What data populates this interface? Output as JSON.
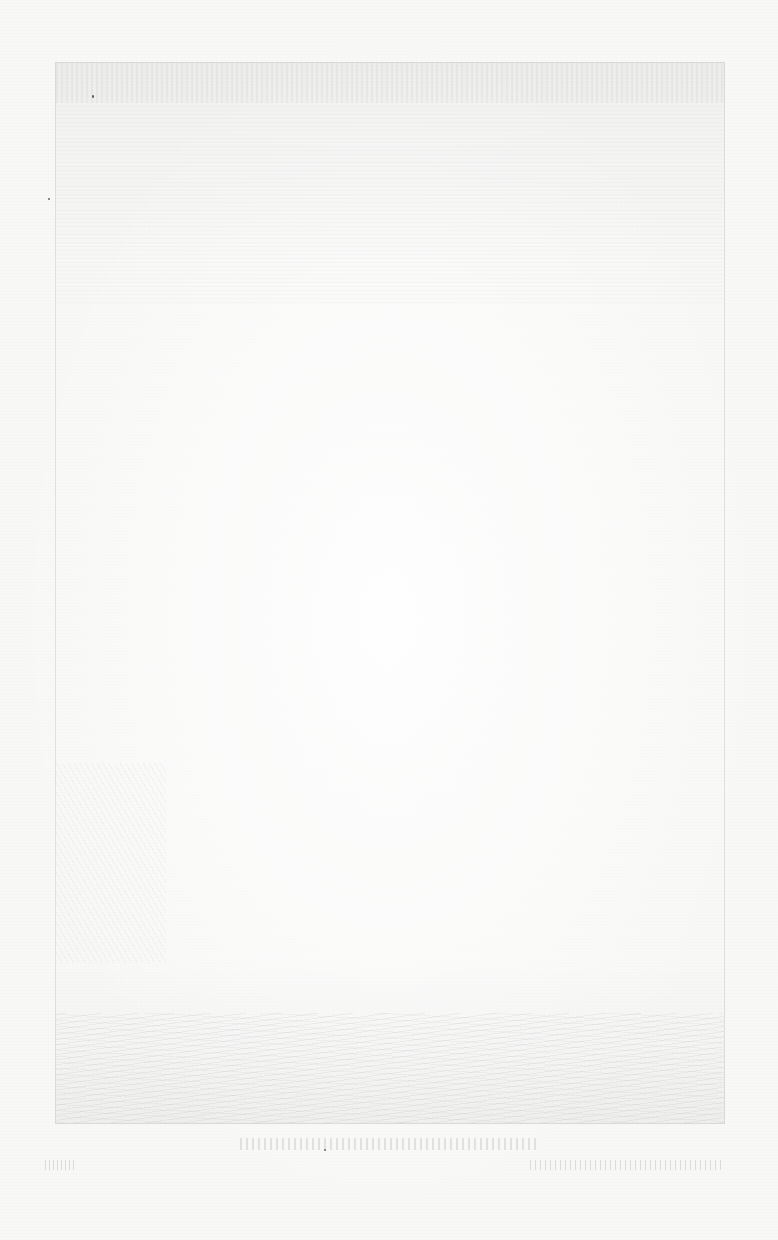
{
  "document": {
    "type": "faded scanned page with bleed-through engraving",
    "plate": {
      "visible": true,
      "content": "faint engraved landscape (bleed-through), illegible"
    },
    "caption": "",
    "footer_left": "",
    "footer_right": ""
  }
}
